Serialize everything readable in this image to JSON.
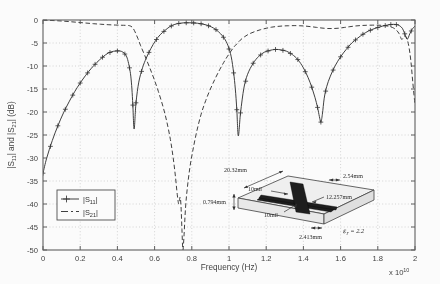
{
  "chart_data": {
    "type": "line",
    "title": "",
    "xlabel": "Frequency (Hz)",
    "ylabel": "|S11| and |S21| (dB)",
    "ylabel_display": "|S   | and |S   | (dB)",
    "x_exponent_label": "x 10",
    "x_exponent_power": "10",
    "xlim": [
      0,
      20000000000.0
    ],
    "ylim": [
      -50,
      0
    ],
    "xticks": [
      0,
      0.2,
      0.4,
      0.6,
      0.8,
      1,
      1.2,
      1.4,
      1.6,
      1.8,
      2
    ],
    "xticklabels": [
      "0",
      "0.2",
      "0.4",
      "0.6",
      "0.8",
      "1",
      "1.2",
      "1.4",
      "1.6",
      "1.8",
      "2"
    ],
    "yticks": [
      0,
      -5,
      -10,
      -15,
      -20,
      -25,
      -30,
      -35,
      -40,
      -45,
      -50
    ],
    "yticklabels": [
      "0",
      "-5",
      "-10",
      "-15",
      "-20",
      "-25",
      "-30",
      "-35",
      "-40",
      "-45",
      "-50"
    ],
    "grid": true,
    "legend_position": "lower-left",
    "legend": [
      {
        "label": "|S11|",
        "base": "|S",
        "sub": "11",
        "tail": "|",
        "style": "solid-with-plus-markers"
      },
      {
        "label": "|S21|",
        "base": "|S",
        "sub": "21",
        "tail": "|",
        "style": "dash-dot"
      }
    ],
    "series": [
      {
        "name": "|S11|",
        "style": "solid-with-plus-markers",
        "x": [
          0.0,
          0.02,
          0.05,
          0.08,
          0.11,
          0.14,
          0.17,
          0.2,
          0.23,
          0.26,
          0.29,
          0.32,
          0.35,
          0.38,
          0.41,
          0.43,
          0.445,
          0.455,
          0.465,
          0.472,
          0.478,
          0.483,
          0.49,
          0.5,
          0.515,
          0.535,
          0.555,
          0.58,
          0.605,
          0.63,
          0.655,
          0.68,
          0.705,
          0.73,
          0.755,
          0.78,
          0.805,
          0.83,
          0.855,
          0.88,
          0.905,
          0.93,
          0.955,
          0.975,
          0.995,
          1.012,
          1.025,
          1.034,
          1.042,
          1.05,
          1.062,
          1.08,
          1.1,
          1.13,
          1.16,
          1.19,
          1.22,
          1.25,
          1.28,
          1.31,
          1.34,
          1.37,
          1.4,
          1.425,
          1.445,
          1.462,
          1.476,
          1.486,
          1.494,
          1.502,
          1.512,
          1.525,
          1.545,
          1.57,
          1.6,
          1.63,
          1.66,
          1.69,
          1.72,
          1.75,
          1.78,
          1.81,
          1.84,
          1.865,
          1.885,
          1.9,
          1.915,
          1.932,
          1.945,
          1.958,
          1.972,
          1.985,
          2.0
        ],
        "y": [
          -33.3,
          -30.0,
          -26.2,
          -23.0,
          -20.2,
          -17.8,
          -15.6,
          -13.7,
          -12.0,
          -10.5,
          -9.2,
          -8.1,
          -7.2,
          -6.8,
          -6.7,
          -7.0,
          -7.6,
          -8.6,
          -10.4,
          -12.2,
          -15.0,
          -18.5,
          -23.7,
          -18.0,
          -13.5,
          -10.4,
          -8.3,
          -6.2,
          -4.5,
          -3.2,
          -2.3,
          -1.5,
          -1.0,
          -0.75,
          -0.62,
          -0.6,
          -0.62,
          -0.7,
          -0.85,
          -1.1,
          -1.5,
          -2.1,
          -3.0,
          -4.0,
          -5.6,
          -8.0,
          -11.5,
          -15.0,
          -19.5,
          -25.2,
          -20.2,
          -14.8,
          -11.8,
          -9.4,
          -7.9,
          -7.0,
          -6.6,
          -6.4,
          -6.5,
          -6.8,
          -7.5,
          -8.6,
          -10.4,
          -12.5,
          -14.6,
          -16.8,
          -19.0,
          -21.0,
          -22.2,
          -20.5,
          -17.0,
          -14.5,
          -12.2,
          -10.0,
          -8.0,
          -6.4,
          -5.0,
          -4.0,
          -3.1,
          -2.4,
          -1.9,
          -1.5,
          -1.2,
          -1.0,
          -0.95,
          -1.0,
          -1.2,
          -1.8,
          -3.0,
          -4.2,
          -3.0,
          -2.0,
          -1.3
        ],
        "marker_x": [
          0.0,
          0.04,
          0.08,
          0.12,
          0.16,
          0.2,
          0.24,
          0.28,
          0.32,
          0.36,
          0.4,
          0.44,
          0.465,
          0.483,
          0.5,
          0.53,
          0.57,
          0.61,
          0.65,
          0.69,
          0.73,
          0.77,
          0.81,
          0.85,
          0.89,
          0.93,
          0.97,
          1.0,
          1.025,
          1.042,
          1.062,
          1.09,
          1.13,
          1.17,
          1.21,
          1.25,
          1.29,
          1.33,
          1.37,
          1.41,
          1.445,
          1.476,
          1.494,
          1.52,
          1.56,
          1.6,
          1.64,
          1.68,
          1.72,
          1.76,
          1.8,
          1.84,
          1.87,
          1.9,
          1.945,
          1.98
        ],
        "minima": [
          {
            "x": 0.483,
            "y": -23.7
          },
          {
            "x": 1.042,
            "y": -25.2
          },
          {
            "x": 1.494,
            "y": -22.2
          }
        ],
        "maxima": [
          {
            "x": 0.35,
            "y": -6.7
          },
          {
            "x": 0.76,
            "y": -0.6
          },
          {
            "x": 1.26,
            "y": -6.4
          },
          {
            "x": 1.8,
            "y": -0.95
          }
        ]
      },
      {
        "name": "|S21|",
        "style": "dash-dot",
        "x": [
          0.0,
          0.03,
          0.07,
          0.11,
          0.15,
          0.19,
          0.23,
          0.27,
          0.31,
          0.35,
          0.39,
          0.42,
          0.445,
          0.46,
          0.472,
          0.483,
          0.495,
          0.51,
          0.525,
          0.545,
          0.57,
          0.595,
          0.62,
          0.645,
          0.665,
          0.685,
          0.7,
          0.712,
          0.722,
          0.73,
          0.737,
          0.742,
          0.747,
          0.752,
          0.758,
          0.766,
          0.776,
          0.79,
          0.805,
          0.825,
          0.85,
          0.875,
          0.9,
          0.925,
          0.95,
          0.972,
          0.99,
          1.01,
          1.028,
          1.042,
          1.06,
          1.085,
          1.11,
          1.14,
          1.17,
          1.2,
          1.23,
          1.26,
          1.29,
          1.32,
          1.35,
          1.38,
          1.41,
          1.44,
          1.47,
          1.5,
          1.53,
          1.56,
          1.59,
          1.62,
          1.65,
          1.68,
          1.71,
          1.74,
          1.77,
          1.8,
          1.825,
          1.85,
          1.87,
          1.885,
          1.9,
          1.915,
          1.928,
          1.938,
          1.948,
          1.958,
          1.968,
          1.978,
          1.988,
          2.0
        ],
        "y": [
          -0.05,
          -0.08,
          -0.15,
          -0.25,
          -0.38,
          -0.52,
          -0.66,
          -0.8,
          -0.92,
          -1.02,
          -1.1,
          -1.14,
          -1.16,
          -1.2,
          -1.35,
          -1.7,
          -2.6,
          -4.0,
          -5.6,
          -7.5,
          -10.0,
          -12.6,
          -15.5,
          -18.8,
          -22.0,
          -26.0,
          -30.0,
          -34.0,
          -38.0,
          -40.0,
          -38.5,
          -40.5,
          -45.5,
          -52.0,
          -47.0,
          -41.0,
          -36.5,
          -32.0,
          -28.5,
          -24.5,
          -20.5,
          -17.5,
          -15.0,
          -12.8,
          -10.8,
          -9.2,
          -8.0,
          -6.8,
          -5.8,
          -5.2,
          -4.4,
          -3.6,
          -3.0,
          -2.5,
          -2.1,
          -1.8,
          -1.55,
          -1.4,
          -1.3,
          -1.25,
          -1.22,
          -1.25,
          -1.32,
          -1.45,
          -1.6,
          -1.75,
          -1.85,
          -1.85,
          -1.78,
          -1.62,
          -1.45,
          -1.3,
          -1.2,
          -1.15,
          -1.12,
          -1.12,
          -1.18,
          -1.3,
          -1.5,
          -1.75,
          -2.2,
          -3.0,
          -4.2,
          -3.8,
          -3.5,
          -4.2,
          -6.0,
          -9.0,
          -13.5,
          -18.5
        ],
        "minima": [
          {
            "x": 0.752,
            "y": -52.0
          }
        ]
      }
    ]
  },
  "inset": {
    "name": "cross-shaped-patch-geometry",
    "dimensions": [
      {
        "id": "substrate-width",
        "label": "20.32mm"
      },
      {
        "id": "substrate-thickness",
        "label": "0.794mm"
      },
      {
        "id": "arm-gap-upper",
        "label": "10mil"
      },
      {
        "id": "arm-gap-lower",
        "label": "10mil"
      },
      {
        "id": "feed-width",
        "label": "2.54mm"
      },
      {
        "id": "patch-length",
        "label": "12.257mm"
      },
      {
        "id": "feed-offset",
        "label": "2.413mm"
      }
    ],
    "permittivity": {
      "symbol": "e",
      "subscript": "r",
      "equals": " = 2.2",
      "full": "er = 2.2"
    }
  },
  "colors": {
    "curve": "#2e2e2e",
    "axis": "#5a5a5a",
    "grid": "#b9b9b9",
    "background": "#ffffff",
    "patch": "#161616"
  }
}
